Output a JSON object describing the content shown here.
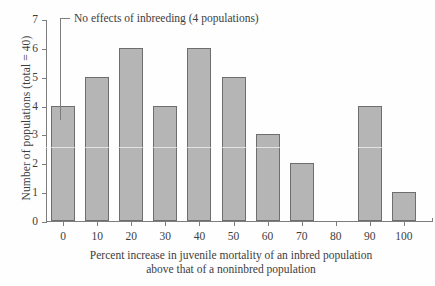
{
  "chart_data": {
    "type": "bar",
    "title": "",
    "xlabel": "Percent increase in juvenile mortality of an inbred population above that of a noninbred population",
    "xlabel_line1": "Percent increase in juvenile mortality of an inbred population",
    "xlabel_line2": "above that of a noninbred population",
    "ylabel": "Number of populations (total = 40)",
    "categories": [
      "0",
      "10",
      "20",
      "30",
      "40",
      "50",
      "60",
      "70",
      "80",
      "90",
      "100"
    ],
    "values": [
      4,
      5,
      6,
      4,
      6,
      5,
      3,
      2,
      0,
      4,
      1
    ],
    "xlim": [
      -5,
      105
    ],
    "ylim": [
      0,
      7
    ],
    "yticks": [
      "0",
      "1",
      "2",
      "3",
      "4",
      "5",
      "6",
      "7"
    ],
    "xticks": [
      "0",
      "10",
      "20",
      "30",
      "40",
      "50",
      "60",
      "70",
      "80",
      "90",
      "100"
    ],
    "grid": false,
    "legend": null,
    "bar_color": "#b5b5b5",
    "bar_edge_color": "#6e6e6e",
    "axis_color": "#7d7d7d",
    "annotations": [
      {
        "text": "No effects of inbreeding (4 populations)",
        "points_to_category": "0",
        "points_to_value": 4
      }
    ]
  }
}
